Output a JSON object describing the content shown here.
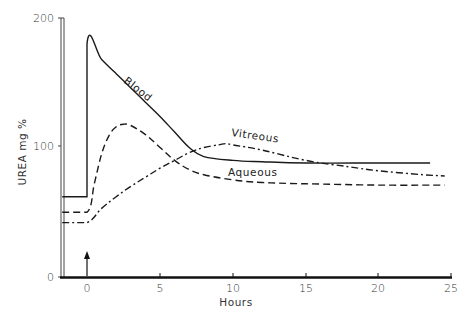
{
  "chart_data": {
    "type": "line",
    "title": "",
    "xlabel": "Hours",
    "ylabel": "UREA mg %",
    "xlim": [
      -1.7,
      25
    ],
    "ylim": [
      0,
      200
    ],
    "x_ticks": [
      0,
      5,
      10,
      15,
      20,
      25
    ],
    "x_tick_labels": [
      "0",
      "5",
      "10",
      "15",
      "20",
      "25"
    ],
    "y_ticks": [
      0,
      100,
      200
    ],
    "y_tick_labels": [
      "0",
      "100",
      "200"
    ],
    "grid": false,
    "legend": "inline labels on curves",
    "annotations": [
      {
        "type": "arrow",
        "x": 0,
        "label": "",
        "description": "upward arrow at time 0 marking injection"
      }
    ],
    "series": [
      {
        "name": "Blood",
        "style": "solid",
        "x": [
          -1.7,
          0,
          0,
          1,
          2,
          3,
          4,
          5,
          6,
          7,
          8,
          10,
          12,
          15,
          20,
          23.5
        ],
        "y": [
          62,
          62,
          180,
          168,
          157,
          146,
          135,
          124,
          112,
          100,
          93,
          90,
          89,
          88,
          88,
          88
        ]
      },
      {
        "name": "Vitreous",
        "style": "dash-dot",
        "x": [
          -1.7,
          0,
          1,
          2,
          3,
          4,
          5,
          6,
          7,
          8,
          9,
          9.5,
          10,
          12,
          15,
          18,
          20,
          23,
          24.5
        ],
        "y": [
          42,
          42,
          53,
          62,
          70,
          77,
          84,
          90,
          96,
          100,
          102,
          103,
          102,
          98,
          90,
          85,
          82,
          79,
          78
        ]
      },
      {
        "name": "Aqueous",
        "style": "dashed",
        "x": [
          -1.7,
          0,
          0.5,
          1,
          1.5,
          2,
          2.5,
          3,
          4,
          5,
          6,
          7,
          8,
          10,
          12,
          15,
          20,
          24.5
        ],
        "y": [
          50,
          50,
          72,
          95,
          109,
          116,
          118,
          117,
          110,
          100,
          90,
          83,
          79,
          75,
          73,
          72,
          71,
          71
        ]
      }
    ]
  },
  "labels": {
    "y_axis_title": "UREA  mg  %",
    "x_axis_title": "Hours",
    "blood": "Blood",
    "vitreous": "Vitreous",
    "aqueous": "Aqueous",
    "y_tick_0": "0",
    "y_tick_100": "100",
    "y_tick_200": "200",
    "x_tick_0": "0",
    "x_tick_5": "5",
    "x_tick_10": "10",
    "x_tick_15": "15",
    "x_tick_20": "20",
    "x_tick_25": "25"
  },
  "colors": {
    "ink": "#1a1a1a",
    "axis": "#222222",
    "background": "#ffffff"
  }
}
